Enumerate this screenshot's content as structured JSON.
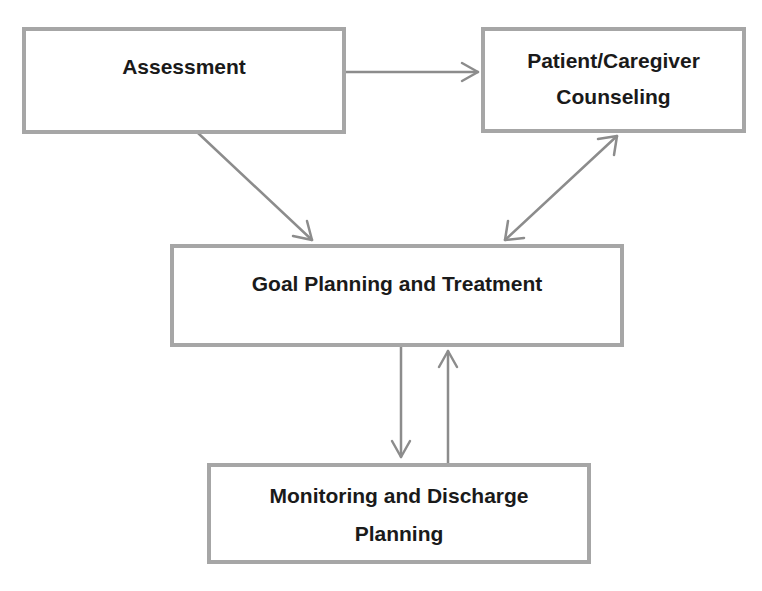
{
  "diagram": {
    "nodes": {
      "assessment": {
        "label": "Assessment"
      },
      "counseling": {
        "label_line1": "Patient/Caregiver",
        "label_line2": "Counseling"
      },
      "goal": {
        "label": "Goal Planning and Treatment"
      },
      "monitoring": {
        "label_line1": "Monitoring and Discharge",
        "label_line2": "Planning"
      }
    },
    "edges": [
      {
        "from": "assessment",
        "to": "counseling",
        "direction": "forward"
      },
      {
        "from": "assessment",
        "to": "goal",
        "direction": "forward"
      },
      {
        "from": "counseling",
        "to": "goal",
        "direction": "bidirectional"
      },
      {
        "from": "goal",
        "to": "monitoring",
        "direction": "forward"
      },
      {
        "from": "monitoring",
        "to": "goal",
        "direction": "forward"
      }
    ],
    "colors": {
      "border": "#a6a6a6",
      "arrow": "#8c8c8c",
      "text": "#1a1a1a"
    }
  }
}
